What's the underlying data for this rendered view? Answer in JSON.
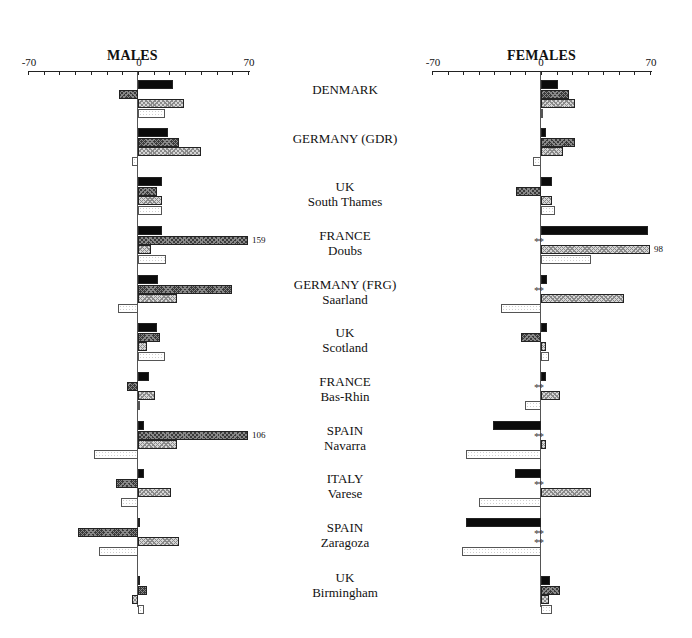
{
  "chart_data": [
    {
      "type": "bar",
      "orientation": "horizontal",
      "title": "MALES",
      "xlim": [
        -70,
        70
      ],
      "xticks": [
        -70,
        0,
        70
      ],
      "minor_tick_step": 10,
      "series_order": [
        "series1 (black)",
        "series2 (dark crosshatch)",
        "series3 (light crosshatch)",
        "series4 (white dotted)"
      ],
      "categories": [
        "DENMARK",
        "GERMANY (GDR)",
        "UK South Thames",
        "FRANCE Doubs",
        "GERMANY (FRG) Saarland",
        "UK Scotland",
        "FRANCE Bas-Rhin",
        "SPAIN Navarra",
        "ITALY Varese",
        "SPAIN Zaragoza",
        "UK Birmingham"
      ],
      "series": [
        {
          "name": "series1",
          "values": [
            22,
            19,
            15,
            15,
            13,
            12,
            7,
            4,
            4,
            1,
            0
          ]
        },
        {
          "name": "series2",
          "values": [
            -12,
            26,
            12,
            159,
            60,
            14,
            -7,
            106,
            -14,
            -38,
            6
          ]
        },
        {
          "name": "series3",
          "values": [
            29,
            40,
            15,
            8,
            25,
            6,
            11,
            25,
            21,
            26,
            -4
          ]
        },
        {
          "name": "series4",
          "values": [
            17,
            -4,
            15,
            18,
            -13,
            17,
            1,
            -28,
            -11,
            -25,
            4
          ]
        }
      ],
      "annotations": [
        {
          "category": "FRANCE Doubs",
          "series": "series2",
          "text": "159",
          "note": "bar truncated at axis limit"
        },
        {
          "category": "SPAIN Navarra",
          "series": "series2",
          "text": "106",
          "note": "bar truncated at axis limit"
        }
      ]
    },
    {
      "type": "bar",
      "orientation": "horizontal",
      "title": "FEMALES",
      "xlim": [
        -70,
        70
      ],
      "xticks": [
        -70,
        0,
        70
      ],
      "minor_tick_step": 10,
      "categories": [
        "DENMARK",
        "GERMANY (GDR)",
        "UK South Thames",
        "FRANCE Doubs",
        "GERMANY (FRG) Saarland",
        "UK Scotland",
        "FRANCE Bas-Rhin",
        "SPAIN Navarra",
        "ITALY Varese",
        "SPAIN Zaragoza",
        "UK Birmingham"
      ],
      "series": [
        {
          "name": "series1",
          "values": [
            11,
            3,
            7,
            69,
            4,
            4,
            3,
            -31,
            -17,
            -48,
            6
          ]
        },
        {
          "name": "series2",
          "values": [
            18,
            22,
            -16,
            "**",
            "**",
            -13,
            "**",
            "**",
            "**",
            "**",
            12
          ]
        },
        {
          "name": "series3",
          "values": [
            22,
            14,
            7,
            98,
            53,
            3,
            12,
            3,
            32,
            "**",
            5
          ]
        },
        {
          "name": "series4",
          "values": [
            1,
            -5,
            9,
            32,
            -26,
            5,
            -10,
            -48,
            -40,
            -51,
            7
          ]
        }
      ],
      "annotations": [
        {
          "category": "FRANCE Doubs",
          "series": "series3",
          "text": "98",
          "note": "bar truncated at axis limit"
        },
        {
          "text": "**",
          "note": "no value shown for that series"
        }
      ]
    }
  ],
  "panels": {
    "males": {
      "title": "MALES",
      "tick_left": "-70",
      "tick_zero": "0",
      "tick_right": "70"
    },
    "females": {
      "title": "FEMALES",
      "tick_left": "-70",
      "tick_zero": "0",
      "tick_right": "70"
    }
  },
  "regions": [
    {
      "line1": "DENMARK",
      "line2": ""
    },
    {
      "line1": "GERMANY (GDR)",
      "line2": ""
    },
    {
      "line1": "UK",
      "line2": "South Thames"
    },
    {
      "line1": "FRANCE",
      "line2": "Doubs"
    },
    {
      "line1": "GERMANY (FRG)",
      "line2": "Saarland"
    },
    {
      "line1": "UK",
      "line2": "Scotland"
    },
    {
      "line1": "FRANCE",
      "line2": "Bas-Rhin"
    },
    {
      "line1": "SPAIN",
      "line2": "Navarra"
    },
    {
      "line1": "ITALY",
      "line2": "Varese"
    },
    {
      "line1": "SPAIN",
      "line2": "Zaragoza"
    },
    {
      "line1": "UK",
      "line2": "Birmingham"
    }
  ],
  "missing_marker": "**"
}
